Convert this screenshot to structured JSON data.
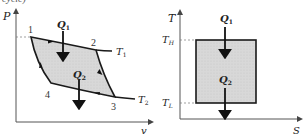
{
  "caption_fragment": "cycle)",
  "pv_diagram": {
    "y_axis_label": "P",
    "x_axis_label": "v",
    "points": [
      {
        "id": "1",
        "x": 31,
        "y": 37
      },
      {
        "id": "2",
        "x": 96,
        "y": 50
      },
      {
        "id": "3",
        "x": 115,
        "y": 97
      },
      {
        "id": "4",
        "x": 51,
        "y": 83
      }
    ],
    "isotherm_high_label": "T",
    "isotherm_high_sub": "1",
    "isotherm_low_label": "T",
    "isotherm_low_sub": "2",
    "heat_in_label": "Q",
    "heat_in_sub": "1",
    "heat_out_label": "Q",
    "heat_out_sub": "2"
  },
  "ts_diagram": {
    "y_axis_label": "T",
    "x_axis_label": "S",
    "high_temp_label": "T",
    "high_temp_sub": "H",
    "low_temp_label": "T",
    "low_temp_sub": "L",
    "heat_in_label": "Q",
    "heat_in_sub": "1",
    "heat_out_label": "Q",
    "heat_out_sub": "2"
  },
  "colors": {
    "fill": "#d6d6d6",
    "line": "#1a1a1a",
    "axis": "#555555"
  }
}
